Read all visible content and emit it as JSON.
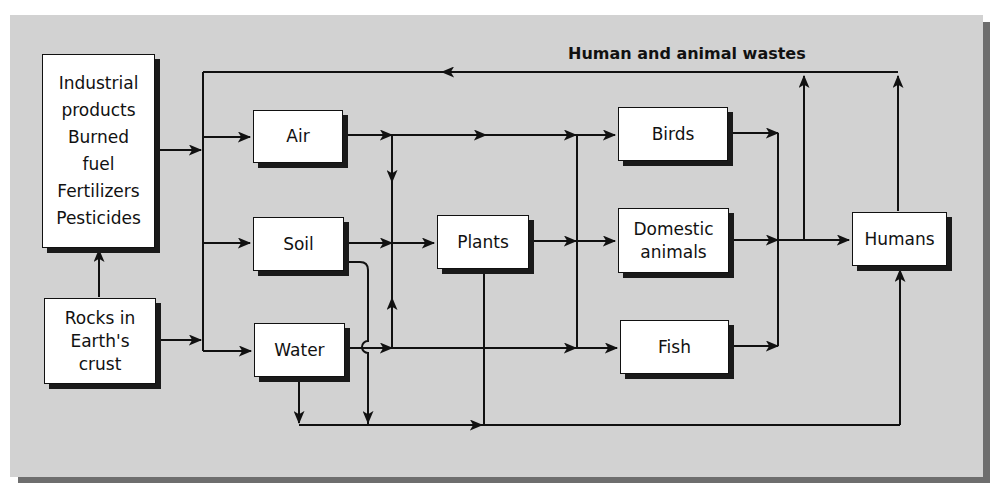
{
  "diagram": {
    "colors": {
      "panel": "#d2d2d2",
      "panel_shadow": "#6e6e6e",
      "box": "#ffffff",
      "line": "#111111"
    },
    "nodes": {
      "sources": {
        "lines": [
          "Industrial",
          "products",
          "Burned",
          "fuel",
          "Fertilizers",
          "Pesticides"
        ]
      },
      "rocks": {
        "lines": [
          "Rocks in",
          "Earth's",
          "crust"
        ]
      },
      "air": {
        "label": "Air"
      },
      "soil": {
        "label": "Soil"
      },
      "water": {
        "label": "Water"
      },
      "plants": {
        "label": "Plants"
      },
      "birds": {
        "label": "Birds"
      },
      "domestic": {
        "lines": [
          "Domestic",
          "animals"
        ]
      },
      "fish": {
        "label": "Fish"
      },
      "humans": {
        "label": "Humans"
      }
    },
    "edge_label": "Human and animal wastes",
    "edges": [
      {
        "from": "Rocks in Earth's crust",
        "to": "Industrial products / Burned fuel / Fertilizers / Pesticides"
      },
      {
        "from": "Industrial products / Burned fuel / Fertilizers / Pesticides",
        "to": "Air, Soil, Water"
      },
      {
        "from": "Rocks in Earth's crust",
        "to": "Air, Soil, Water"
      },
      {
        "from": "Air",
        "to": "Birds, Plants"
      },
      {
        "from": "Soil",
        "to": "Plants"
      },
      {
        "from": "Soil",
        "to": "Humans (via bottom line)"
      },
      {
        "from": "Water",
        "to": "Plants, Fish"
      },
      {
        "from": "Water",
        "to": "Humans (via bottom line)"
      },
      {
        "from": "Plants",
        "to": "Birds, Domestic animals, Fish"
      },
      {
        "from": "Plants",
        "to": "Humans (via bottom line)"
      },
      {
        "from": "Birds, Domestic animals, Fish",
        "to": "Humans"
      },
      {
        "from": "Humans, animals",
        "to": "Air, Soil, Water",
        "label": "Human and animal wastes"
      }
    ]
  }
}
